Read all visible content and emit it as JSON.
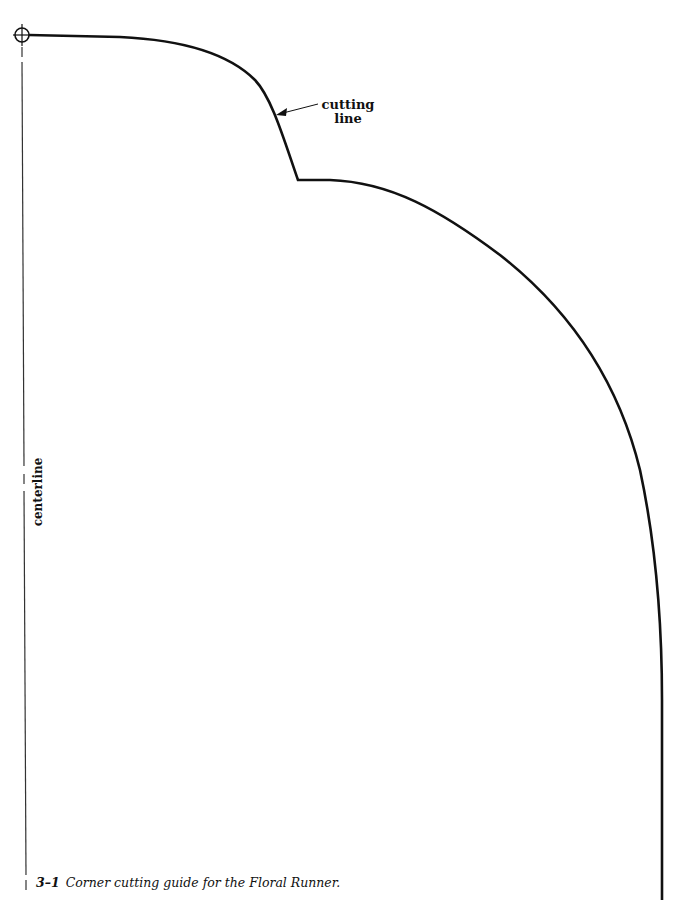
{
  "figure": {
    "labels": {
      "cutting_line_line1": "cutting",
      "cutting_line_line2": "line",
      "centerline": "centerline"
    },
    "caption": {
      "number": "3–1",
      "text": "Corner cutting guide for the Floral Runner."
    },
    "colors": {
      "background": "#ffffff",
      "stroke": "#111111"
    }
  }
}
